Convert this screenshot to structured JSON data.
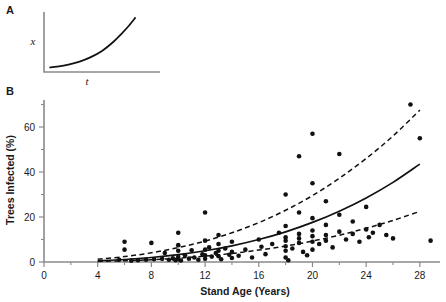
{
  "figure": {
    "panels": [
      {
        "id": "A",
        "label": "A"
      },
      {
        "id": "B",
        "label": "B"
      }
    ]
  },
  "panel_a": {
    "label": "A",
    "ylabel": "x",
    "xlabel": "t"
  },
  "panel_b": {
    "label": "B"
  },
  "chart_data": [
    {
      "type": "line",
      "id": "panel-a",
      "title": "",
      "xlabel": "t",
      "ylabel": "x",
      "grid": false,
      "legend": null,
      "xlim": [
        0,
        10
      ],
      "ylim": [
        0,
        10
      ],
      "xticks": [],
      "yticks": [],
      "series": [
        {
          "name": "exponential-growth",
          "style": "solid",
          "x": [
            0.3,
            1.0,
            2.0,
            3.0,
            4.0,
            5.0,
            6.0,
            6.8,
            7.4,
            8.0
          ],
          "y": [
            0.45,
            0.6,
            0.95,
            1.5,
            2.3,
            3.4,
            5.0,
            6.6,
            7.9,
            9.4
          ]
        }
      ]
    },
    {
      "type": "scatter",
      "id": "panel-b",
      "title": "",
      "xlabel": "Stand Age (Years)",
      "ylabel": "Trees Infected (%)",
      "grid": false,
      "legend": null,
      "xlim": [
        0,
        29.5
      ],
      "ylim": [
        0,
        72
      ],
      "xticks": [
        0,
        4,
        8,
        12,
        16,
        20,
        24,
        28
      ],
      "xminorticks": [
        2,
        6,
        10,
        14,
        18,
        22,
        26
      ],
      "yticks": [
        0,
        20,
        40,
        60
      ],
      "yminorticks": [
        10,
        30,
        50,
        70
      ],
      "xtick_labels": [
        "0",
        "4",
        "8",
        "12",
        "16",
        "20",
        "24",
        "28"
      ],
      "ytick_labels": [
        "0",
        "20",
        "40",
        "60"
      ],
      "points": [
        [
          5.6,
          1.0
        ],
        [
          6.0,
          5.5
        ],
        [
          6.0,
          9.0
        ],
        [
          6.5,
          0.6
        ],
        [
          7.0,
          0.8
        ],
        [
          7.6,
          1.0
        ],
        [
          8.0,
          8.5
        ],
        [
          8.2,
          1.2
        ],
        [
          8.8,
          1.4
        ],
        [
          9.0,
          4.0
        ],
        [
          9.3,
          1.0
        ],
        [
          9.6,
          1.6
        ],
        [
          9.8,
          0.8
        ],
        [
          10.0,
          13.0
        ],
        [
          10.0,
          7.5
        ],
        [
          10.0,
          5.0
        ],
        [
          10.0,
          2.2
        ],
        [
          10.0,
          1.2
        ],
        [
          10.2,
          0.7
        ],
        [
          10.5,
          3.0
        ],
        [
          10.8,
          1.5
        ],
        [
          11.0,
          5.2
        ],
        [
          11.2,
          2.0
        ],
        [
          11.5,
          1.0
        ],
        [
          11.8,
          3.4
        ],
        [
          12.0,
          22.0
        ],
        [
          12.0,
          9.5
        ],
        [
          12.0,
          5.5
        ],
        [
          12.0,
          3.0
        ],
        [
          12.0,
          1.4
        ],
        [
          12.3,
          6.5
        ],
        [
          12.5,
          2.4
        ],
        [
          12.8,
          4.0
        ],
        [
          13.0,
          12.0
        ],
        [
          13.0,
          8.0
        ],
        [
          13.0,
          5.0
        ],
        [
          13.0,
          2.6
        ],
        [
          13.2,
          1.2
        ],
        [
          13.5,
          6.0
        ],
        [
          13.8,
          3.2
        ],
        [
          14.0,
          9.0
        ],
        [
          14.0,
          4.5
        ],
        [
          14.0,
          1.8
        ],
        [
          14.5,
          2.8
        ],
        [
          15.0,
          5.5
        ],
        [
          15.5,
          2.0
        ],
        [
          16.0,
          10.0
        ],
        [
          16.2,
          6.8
        ],
        [
          16.5,
          3.5
        ],
        [
          17.0,
          8.0
        ],
        [
          17.5,
          13.0
        ],
        [
          18.0,
          30.0
        ],
        [
          18.0,
          16.0
        ],
        [
          18.0,
          11.0
        ],
        [
          18.0,
          9.5
        ],
        [
          18.0,
          7.0
        ],
        [
          18.0,
          5.0
        ],
        [
          18.0,
          2.0
        ],
        [
          18.2,
          0.8
        ],
        [
          18.5,
          6.0
        ],
        [
          19.0,
          47.0
        ],
        [
          19.0,
          22.0
        ],
        [
          19.0,
          12.5
        ],
        [
          19.0,
          10.5
        ],
        [
          19.0,
          8.5
        ],
        [
          19.3,
          4.5
        ],
        [
          19.6,
          3.0
        ],
        [
          20.0,
          57.0
        ],
        [
          20.0,
          35.0
        ],
        [
          20.0,
          19.5
        ],
        [
          20.0,
          14.0
        ],
        [
          20.0,
          11.5
        ],
        [
          20.0,
          9.0
        ],
        [
          20.0,
          5.5
        ],
        [
          20.5,
          8.0
        ],
        [
          21.0,
          27.0
        ],
        [
          21.0,
          16.5
        ],
        [
          21.0,
          12.0
        ],
        [
          21.0,
          9.5
        ],
        [
          21.5,
          6.5
        ],
        [
          22.0,
          48.0
        ],
        [
          22.0,
          21.0
        ],
        [
          22.0,
          13.5
        ],
        [
          22.5,
          10.0
        ],
        [
          23.0,
          18.0
        ],
        [
          23.0,
          12.5
        ],
        [
          23.5,
          9.0
        ],
        [
          24.0,
          24.5
        ],
        [
          24.0,
          14.5
        ],
        [
          24.2,
          11.0
        ],
        [
          24.5,
          13.0
        ],
        [
          25.0,
          16.5
        ],
        [
          25.5,
          12.0
        ],
        [
          26.0,
          10.5
        ],
        [
          27.3,
          70.0
        ],
        [
          28.0,
          55.0
        ],
        [
          28.8,
          9.5
        ]
      ],
      "series": [
        {
          "name": "fitted-exponential-model",
          "style": "solid",
          "x": [
            4.0,
            6.0,
            8.0,
            10.0,
            12.0,
            14.0,
            16.0,
            18.0,
            20.0,
            22.0,
            24.0,
            26.0,
            28.0
          ],
          "y": [
            0.55,
            1.1,
            2.0,
            3.3,
            5.0,
            7.2,
            10.0,
            13.4,
            17.6,
            22.6,
            28.5,
            35.4,
            43.5
          ]
        },
        {
          "name": "upper-confidence-band",
          "style": "dashed",
          "x": [
            4.0,
            6.0,
            8.0,
            10.0,
            12.0,
            14.0,
            16.0,
            18.0,
            20.0,
            22.0,
            24.0,
            26.0,
            28.0
          ],
          "y": [
            1.2,
            2.4,
            4.1,
            6.4,
            9.3,
            13.0,
            17.5,
            23.0,
            29.5,
            37.2,
            46.0,
            56.0,
            67.5
          ]
        },
        {
          "name": "lower-confidence-band",
          "style": "dashed",
          "x": [
            4.0,
            6.0,
            8.0,
            10.0,
            12.0,
            14.0,
            16.0,
            18.0,
            20.0,
            22.0,
            24.0,
            26.0,
            28.0
          ],
          "y": [
            0.25,
            0.55,
            1.0,
            1.7,
            2.6,
            3.8,
            5.3,
            7.1,
            9.3,
            11.9,
            15.0,
            18.5,
            22.5
          ]
        }
      ]
    }
  ]
}
